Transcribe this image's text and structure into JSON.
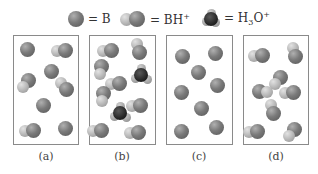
{
  "legend": [
    {
      "species": "B",
      "label": "= B",
      "icon": "base-sphere"
    },
    {
      "species": "BH+",
      "label_main": "= BH",
      "label_sup": "+",
      "icon": "conjugate-acid-molecule"
    },
    {
      "species": "H3O+",
      "label_main": "= H",
      "label_sub": "3",
      "label_mid": "O",
      "label_sup": "+",
      "icon": "hydronium-molecule"
    }
  ],
  "panels": [
    {
      "label": "(a)",
      "molecules": [
        {
          "type": "B",
          "x": 27,
          "y": 49
        },
        {
          "type": "BH+",
          "x": 65,
          "y": 50,
          "h_dir": "left"
        },
        {
          "type": "B",
          "x": 51,
          "y": 71
        },
        {
          "type": "BH+",
          "x": 28,
          "y": 80,
          "h_dir": "down-left"
        },
        {
          "type": "BH+",
          "x": 66,
          "y": 89,
          "h_dir": "up-left"
        },
        {
          "type": "B",
          "x": 43,
          "y": 105
        },
        {
          "type": "BH+",
          "x": 33,
          "y": 130,
          "h_dir": "left"
        },
        {
          "type": "B",
          "x": 65,
          "y": 128
        }
      ]
    },
    {
      "label": "(b)",
      "molecules": [
        {
          "type": "BH+",
          "x": 111,
          "y": 50,
          "h_dir": "left"
        },
        {
          "type": "BH+",
          "x": 139,
          "y": 52,
          "h_dir": "up"
        },
        {
          "type": "BH+",
          "x": 101,
          "y": 66,
          "h_dir": "down"
        },
        {
          "type": "H3O+",
          "x": 141,
          "y": 75
        },
        {
          "type": "BH+",
          "x": 119,
          "y": 83,
          "h_dir": "left"
        },
        {
          "type": "BH+",
          "x": 103,
          "y": 93,
          "h_dir": "down"
        },
        {
          "type": "BH+",
          "x": 140,
          "y": 105,
          "h_dir": "left"
        },
        {
          "type": "H3O+",
          "x": 120,
          "y": 113
        },
        {
          "type": "BH+",
          "x": 101,
          "y": 130,
          "h_dir": "left"
        },
        {
          "type": "BH+",
          "x": 138,
          "y": 132,
          "h_dir": "left"
        }
      ]
    },
    {
      "label": "(c)",
      "molecules": [
        {
          "type": "B",
          "x": 182,
          "y": 56
        },
        {
          "type": "B",
          "x": 215,
          "y": 53
        },
        {
          "type": "B",
          "x": 198,
          "y": 72
        },
        {
          "type": "B",
          "x": 181,
          "y": 92
        },
        {
          "type": "B",
          "x": 217,
          "y": 85
        },
        {
          "type": "B",
          "x": 201,
          "y": 108
        },
        {
          "type": "B",
          "x": 181,
          "y": 131
        },
        {
          "type": "B",
          "x": 216,
          "y": 127
        }
      ]
    },
    {
      "label": "(d)",
      "molecules": [
        {
          "type": "BH+",
          "x": 262,
          "y": 55,
          "h_dir": "left"
        },
        {
          "type": "BH+",
          "x": 295,
          "y": 56,
          "h_dir": "up"
        },
        {
          "type": "BH+",
          "x": 280,
          "y": 77,
          "h_dir": "down-left"
        },
        {
          "type": "BH+",
          "x": 259,
          "y": 91,
          "h_dir": "right"
        },
        {
          "type": "BH+",
          "x": 293,
          "y": 92,
          "h_dir": "left"
        },
        {
          "type": "BH+",
          "x": 273,
          "y": 113,
          "h_dir": "up"
        },
        {
          "type": "BH+",
          "x": 257,
          "y": 131,
          "h_dir": "left"
        },
        {
          "type": "BH+",
          "x": 294,
          "y": 129,
          "h_dir": "down-left"
        }
      ]
    }
  ],
  "colors": {
    "base": "#7a7a7a",
    "hydrogen": "#b4b4b4",
    "oxygen": "#262626",
    "border": "#8a8a8a"
  }
}
